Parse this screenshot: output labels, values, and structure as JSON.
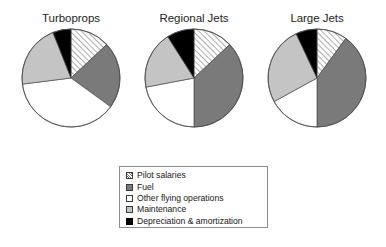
{
  "figure": {
    "background": "#ffffff",
    "width": 386,
    "height": 247
  },
  "panels": [
    {
      "title": "Turboprops"
    },
    {
      "title": "Regional Jets"
    },
    {
      "title": "Large Jets"
    }
  ],
  "legend": {
    "position": "bottom-center",
    "border_color": "#8c8c8c",
    "items": [
      {
        "label": "Pilot salaries",
        "pattern": "diagonal-hatch",
        "fill": "#ffffff",
        "stroke": "#3a3a3a"
      },
      {
        "label": "Fuel",
        "pattern": "solid",
        "fill": "#7a7a7a",
        "stroke": "#3a3a3a"
      },
      {
        "label": "Other flying operations",
        "pattern": "solid",
        "fill": "#ffffff",
        "stroke": "#3a3a3a"
      },
      {
        "label": "Maintenance",
        "pattern": "solid",
        "fill": "#c4c4c4",
        "stroke": "#3a3a3a"
      },
      {
        "label": "Depreciation & amortization",
        "pattern": "solid",
        "fill": "#000000",
        "stroke": "#000000"
      }
    ]
  },
  "chart_data": {
    "type": "pie",
    "title": "",
    "subtitle": "",
    "units": "percent of operating cost",
    "categories": [
      "Pilot salaries",
      "Fuel",
      "Other flying operations",
      "Maintenance",
      "Depreciation & amortization"
    ],
    "colors": [
      "#ffffff",
      "#7a7a7a",
      "#ffffff",
      "#c4c4c4",
      "#000000"
    ],
    "patterns": [
      "diagonal-hatch",
      "solid",
      "solid",
      "solid",
      "solid"
    ],
    "start_angle_deg": 0,
    "direction": "clockwise",
    "legend_position": "bottom-center",
    "grid": false,
    "charts": [
      {
        "title": "Turboprops",
        "labels": [
          "Pilot salaries",
          "Fuel",
          "Other flying operations",
          "Maintenance",
          "Depreciation & amortization"
        ],
        "values": [
          13,
          22,
          38,
          21,
          6
        ]
      },
      {
        "title": "Regional Jets",
        "labels": [
          "Pilot salaries",
          "Fuel",
          "Other flying operations",
          "Maintenance",
          "Depreciation & amortization"
        ],
        "values": [
          13,
          37,
          22,
          19,
          9
        ]
      },
      {
        "title": "Large Jets",
        "labels": [
          "Pilot salaries",
          "Fuel",
          "Other flying operations",
          "Maintenance",
          "Depreciation & amortization"
        ],
        "values": [
          10,
          40,
          17,
          26,
          7
        ]
      }
    ]
  }
}
